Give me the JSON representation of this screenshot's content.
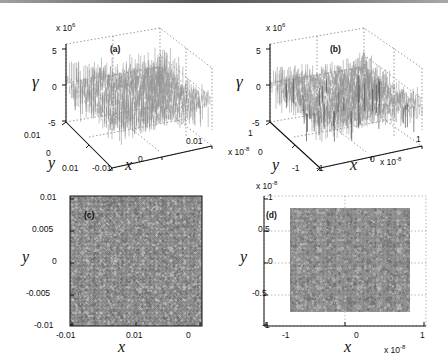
{
  "figure": {
    "kind": "four-panel-scientific-figure",
    "background": "#ffffff",
    "ink": "#111111",
    "surface_fill": "#9a9a9a",
    "map_fill": "#8c8c8c"
  },
  "chart_data": [
    {
      "id": "a",
      "type": "surface",
      "tag": "(a)",
      "title": "",
      "zlabel": "γ",
      "xlabel": "x",
      "ylabel": "y",
      "z_exponent_label": "x 10",
      "z_exponent": "6",
      "zticks": [
        5,
        0,
        -5
      ],
      "ztick_labels": [
        "5",
        "0",
        "-5"
      ],
      "zlim": [
        -5,
        5
      ],
      "xticks": [
        -0.01,
        0,
        0.01
      ],
      "xtick_labels": [
        "-0.01",
        "0",
        "0.01"
      ],
      "xlim": [
        -0.01,
        0.01
      ],
      "yticks": [
        0.01,
        0,
        -0.01
      ],
      "ytick_labels": [
        "0.01",
        "0",
        "0.01"
      ],
      "ylim": [
        -0.01,
        0.01
      ],
      "grid": true,
      "legend": "none",
      "description": "Dense random noise mesh surface, amplitude roughly +/-2.5e6 with occasional spikes to +/-5e6, centred on z=0."
    },
    {
      "id": "b",
      "type": "surface",
      "tag": "(b)",
      "title": "",
      "zlabel": "γ",
      "xlabel": "x",
      "ylabel": "y",
      "z_exponent_label": "x 10",
      "z_exponent": "6",
      "zticks": [
        5,
        0,
        -5
      ],
      "ztick_labels": [
        "5",
        "0",
        "-5"
      ],
      "zlim": [
        -5,
        5
      ],
      "xticks": [
        -1,
        0,
        1
      ],
      "xtick_labels": [
        "-1",
        "0",
        "1"
      ],
      "x_exponent_label": "x 10",
      "x_exponent": "-8",
      "xlim": [
        -1,
        1
      ],
      "yticks": [
        1,
        0,
        -1
      ],
      "ytick_labels": [
        "1",
        "0",
        "-1"
      ],
      "y_exponent_label": "x 10",
      "y_exponent": "-8",
      "ylim": [
        -1,
        1
      ],
      "grid": true,
      "legend": "none",
      "description": "Random noise mesh surface with pronounced downward spikes reaching about -5e6; bulk amplitude near +/-2e6."
    },
    {
      "id": "c",
      "type": "heatmap",
      "tag": "(c)",
      "title": "",
      "xlabel": "x",
      "ylabel": "y",
      "xticks": [
        -0.01,
        0,
        0.01
      ],
      "xtick_labels": [
        "-0.01",
        "0",
        "0.01"
      ],
      "xlim": [
        -0.01,
        0.01
      ],
      "yticks": [
        0.01,
        0.005,
        0,
        -0.005,
        -0.01
      ],
      "ytick_labels": [
        "0.01",
        "0.005",
        "0",
        "-0.005",
        "-0.01"
      ],
      "ylim": [
        -0.01,
        0.01
      ],
      "colormap": "gray",
      "grid": false,
      "legend": "none",
      "description": "Fine-grained grayscale speckle map with a faint regular lattice of bright and dark spots, fills the full axes box."
    },
    {
      "id": "d",
      "type": "heatmap",
      "tag": "(d)",
      "title": "",
      "xlabel": "x",
      "ylabel": "y",
      "xticks": [
        -1,
        0,
        1
      ],
      "xtick_labels": [
        "-1",
        "0",
        "1"
      ],
      "x_exponent_label": "x 10",
      "x_exponent": "-8",
      "xlim": [
        -1,
        1
      ],
      "yticks": [
        1,
        0.5,
        0,
        -0.5,
        -1
      ],
      "ytick_labels": [
        "1",
        "0.5",
        "0",
        "-0.5",
        "-1"
      ],
      "y_exponent_label": "x 10",
      "y_exponent": "-8",
      "ylim": [
        -1,
        1
      ],
      "colormap": "gray",
      "grid": true,
      "legend": "none",
      "description": "Coarser grayscale lattice map occupying roughly x in [-0.78,0.78]e-8 and y in [-0.8,0.8]e-8, blocky checker-like texture."
    }
  ]
}
